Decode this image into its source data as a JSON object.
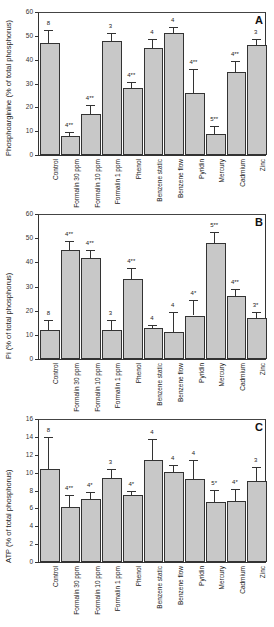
{
  "chart_data": [
    {
      "type": "bar",
      "panel": "A",
      "title": "",
      "xlabel": "",
      "ylabel": "Phosphoarginine (% of total phosphorus)",
      "ylim": [
        0,
        60
      ],
      "yticks": [
        0,
        10,
        20,
        30,
        40,
        50,
        60
      ],
      "grid": false,
      "categories": [
        "Control",
        "Formalin 30 ppm",
        "Formalin 10 ppm",
        "Formalin 1 ppm",
        "Phenol",
        "Benzene static",
        "Benzene flow",
        "Pyridin",
        "Mercury",
        "Cadmium",
        "Zinc"
      ],
      "values": [
        47,
        8,
        17,
        48,
        28,
        45,
        51,
        26,
        9,
        35,
        46
      ],
      "errors": [
        5.5,
        1.8,
        4,
        3,
        2.5,
        3.5,
        2.8,
        10,
        3,
        4.5,
        2.5
      ],
      "annotations": [
        "8",
        "4**",
        "4**",
        "3",
        "4**",
        "4",
        "4",
        "4**",
        "5**",
        "4**",
        "3"
      ]
    },
    {
      "type": "bar",
      "panel": "B",
      "title": "",
      "xlabel": "",
      "ylabel": "Pi (% of total phosphorus)",
      "ylim": [
        0,
        60
      ],
      "yticks": [
        0,
        10,
        20,
        30,
        40,
        50,
        60
      ],
      "grid": false,
      "categories": [
        "Control",
        "Formalin 30 ppm",
        "Formalin 10 ppm",
        "Formalin 1 ppm",
        "Phenol",
        "Benzene static",
        "Benzene flow",
        "Pyridin",
        "Mercury",
        "Cadmium",
        "Zinc"
      ],
      "values": [
        12,
        45,
        42,
        12,
        33,
        13,
        11,
        18,
        48,
        26,
        17
      ],
      "errors": [
        4,
        4,
        3,
        4,
        4.5,
        1.2,
        8.5,
        6.5,
        4.5,
        3,
        2.5
      ],
      "annotations": [
        "8",
        "4**",
        "4**",
        "3",
        "4**",
        "4",
        "4",
        "4*",
        "5**",
        "4**",
        "3*"
      ]
    },
    {
      "type": "bar",
      "panel": "C",
      "title": "",
      "xlabel": "",
      "ylabel": "ATP (% of total phosphorus)",
      "ylim": [
        0,
        16
      ],
      "yticks": [
        0,
        2,
        4,
        6,
        8,
        10,
        12,
        14,
        16
      ],
      "grid": false,
      "categories": [
        "Control",
        "Formalin 30 ppm",
        "Formalin 10 ppm",
        "Formalin 1 ppm",
        "Phenol",
        "Benzene static",
        "Benzene flow",
        "Pyridin",
        "Mercury",
        "Cadmium",
        "Zinc"
      ],
      "values": [
        10.4,
        6.1,
        7.0,
        9.4,
        7.5,
        11.4,
        10.1,
        9.3,
        6.7,
        6.8,
        9.1
      ],
      "errors": [
        3.6,
        1.4,
        0.8,
        1.0,
        0.4,
        2.4,
        0.7,
        2.1,
        1.4,
        1.4,
        1.5
      ],
      "annotations": [
        "8",
        "4**",
        "4*",
        "3",
        "4*",
        "4",
        "4",
        "4",
        "5*",
        "4*",
        "3"
      ]
    }
  ]
}
